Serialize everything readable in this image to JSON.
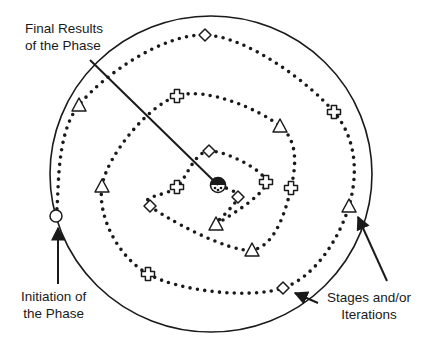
{
  "diagram": {
    "type": "spiral-process",
    "colors": {
      "stroke": "#1a1a1a",
      "background": "#ffffff"
    },
    "boundary_circle": {
      "cx": 211,
      "cy": 174,
      "rx": 161,
      "ry": 158
    },
    "spiral": {
      "start": {
        "x": 56,
        "y": 216
      },
      "center": {
        "x": 218,
        "y": 185
      },
      "direction": "clockwise-inward",
      "style": "dotted"
    },
    "markers": [
      {
        "shape": "circle",
        "x": 56,
        "y": 216,
        "role": "start"
      },
      {
        "shape": "triangle",
        "x": 79,
        "y": 105
      },
      {
        "shape": "diamond",
        "x": 205,
        "y": 35
      },
      {
        "shape": "cross",
        "x": 334,
        "y": 112
      },
      {
        "shape": "triangle",
        "x": 349,
        "y": 206
      },
      {
        "shape": "diamond",
        "x": 283,
        "y": 288
      },
      {
        "shape": "cross",
        "x": 148,
        "y": 274
      },
      {
        "shape": "triangle",
        "x": 102,
        "y": 186
      },
      {
        "shape": "cross",
        "x": 177,
        "y": 96
      },
      {
        "shape": "triangle",
        "x": 280,
        "y": 126
      },
      {
        "shape": "cross",
        "x": 291,
        "y": 188
      },
      {
        "shape": "triangle",
        "x": 252,
        "y": 250
      },
      {
        "shape": "diamond",
        "x": 150,
        "y": 206
      },
      {
        "shape": "cross",
        "x": 177,
        "y": 187
      },
      {
        "shape": "diamond",
        "x": 209,
        "y": 151
      },
      {
        "shape": "cross",
        "x": 266,
        "y": 182
      },
      {
        "shape": "triangle",
        "x": 216,
        "y": 224
      },
      {
        "shape": "diamond",
        "x": 238,
        "y": 197
      }
    ],
    "labels": {
      "final_results": {
        "line1": "Final Results",
        "line2": "of the Phase"
      },
      "initiation": {
        "line1": "Initiation of",
        "line2": "the Phase"
      },
      "stages": {
        "line1": "Stages and/or",
        "line2": "Iterations"
      }
    },
    "arrows": [
      {
        "from": [
          90,
          60
        ],
        "to": [
          218,
          185
        ],
        "label": "final_results"
      },
      {
        "from": [
          58,
          284
        ],
        "to": [
          58,
          228
        ],
        "label": "initiation"
      },
      {
        "from": [
          387,
          281
        ],
        "to": [
          358,
          217
        ],
        "label": "stages"
      },
      {
        "from": [
          318,
          303
        ],
        "to": [
          295,
          293
        ],
        "label": "stages"
      }
    ]
  }
}
